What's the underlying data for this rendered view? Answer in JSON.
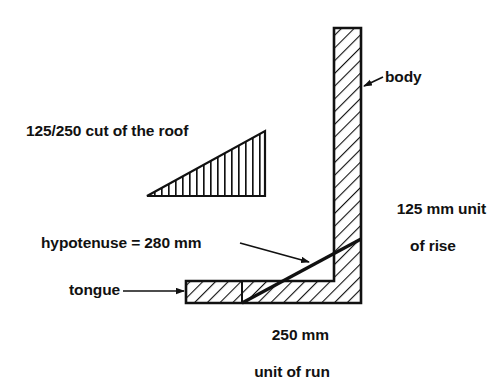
{
  "figure": {
    "ink_color": "#111111",
    "background_color": "#ffffff",
    "labels": {
      "roof_cut": "125/250 cut of the roof",
      "body": "body",
      "rise_line1": "125 mm unit",
      "rise_line2": "of rise",
      "hypotenuse": "hypotenuse = 280 mm",
      "tongue": "tongue",
      "run_line1": "250 mm",
      "run_line2": "unit of run"
    },
    "measurements": {
      "unit_of_rise_mm": 125,
      "unit_of_run_mm": 250,
      "hypotenuse_mm": 280,
      "cut_ratio": "125/250"
    },
    "parts": [
      {
        "name": "body",
        "description": "vertical hatched arm of the framing square"
      },
      {
        "name": "tongue",
        "description": "horizontal hatched arm of the framing square"
      },
      {
        "name": "hypotenuse",
        "description": "diagonal line across the inner corner"
      },
      {
        "name": "roof-cut-triangle",
        "description": "vertically hatched right triangle illustrating the roof pitch"
      }
    ]
  }
}
